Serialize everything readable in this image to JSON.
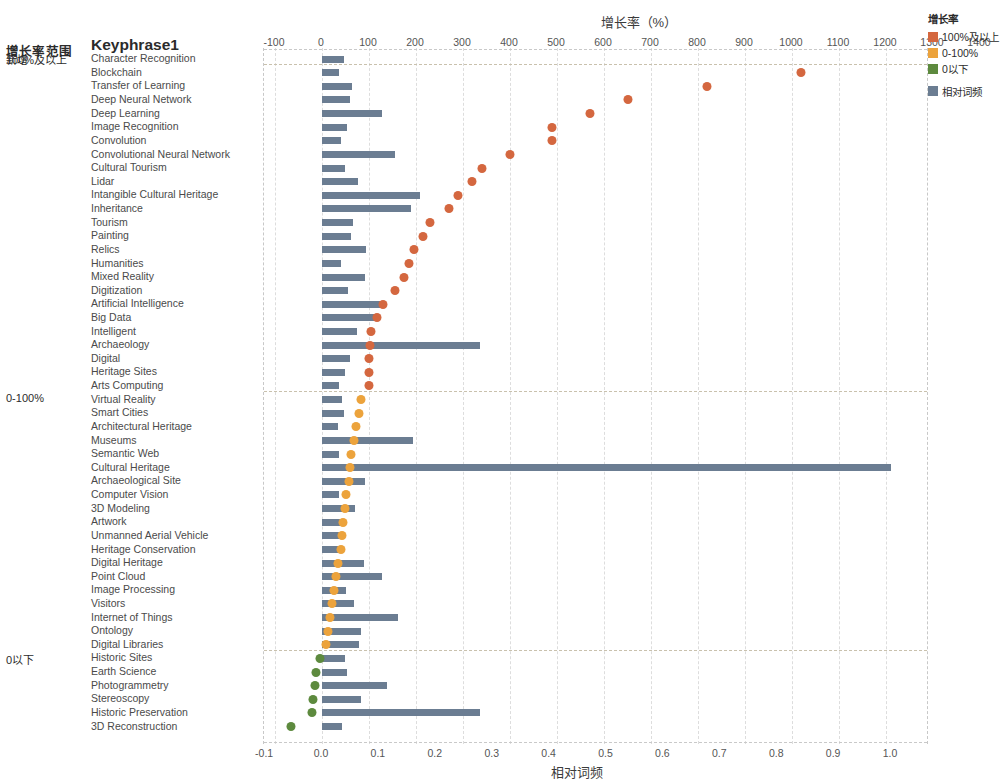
{
  "chart_data": {
    "type": "bar",
    "title": "",
    "top_axis": {
      "label": "增长率（%）",
      "ticks": [
        -100,
        0,
        100,
        200,
        300,
        400,
        500,
        600,
        700,
        800,
        900,
        1000,
        1100,
        1200,
        1300,
        1400,
        1500
      ],
      "range": [
        -100,
        1520
      ]
    },
    "bottom_axis": {
      "label": "相对词频",
      "ticks": [
        "-0.1",
        "0.0",
        "0.1",
        "0.2",
        "0.3",
        "0.4",
        "0.5",
        "0.6",
        "0.7",
        "0.8",
        "0.9",
        "1.0"
      ],
      "tick_values": [
        -0.1,
        0.0,
        0.1,
        0.2,
        0.3,
        0.4,
        0.5,
        0.6,
        0.7,
        0.8,
        0.9,
        1.0
      ],
      "range": [
        -0.115,
        1.06
      ]
    },
    "row_header_left": "增长率范围",
    "row_header_right": "Keyphrase1",
    "groups": [
      {
        "label": "新增",
        "start_index": 0,
        "count": 0
      },
      {
        "label": "100%及以上",
        "start_index": 0,
        "count": 25
      },
      {
        "label": "0-100%",
        "start_index": 25,
        "count": 19
      },
      {
        "label": "0以下",
        "start_index": 44,
        "count": 6
      }
    ],
    "series": [
      {
        "name": "增长率",
        "kind": "dot",
        "unit": "%"
      },
      {
        "name": "相对词频",
        "kind": "bar",
        "unit": ""
      }
    ],
    "rows": [
      {
        "keyphrase": "Character Recognition",
        "growth": 1480,
        "freq": 0.038,
        "band": "100%及以上"
      },
      {
        "keyphrase": "Blockchain",
        "growth": 1020,
        "freq": 0.029,
        "band": "100%及以上"
      },
      {
        "keyphrase": "Transfer of Learning",
        "growth": 820,
        "freq": 0.053,
        "band": "100%及以上"
      },
      {
        "keyphrase": "Deep Neural Network",
        "growth": 650,
        "freq": 0.049,
        "band": "100%及以上"
      },
      {
        "keyphrase": "Deep Learning",
        "growth": 570,
        "freq": 0.105,
        "band": "100%及以上"
      },
      {
        "keyphrase": "Image Recognition",
        "growth": 490,
        "freq": 0.044,
        "band": "100%及以上"
      },
      {
        "keyphrase": "Convolution",
        "growth": 490,
        "freq": 0.033,
        "band": "100%及以上"
      },
      {
        "keyphrase": "Convolutional Neural Network",
        "growth": 400,
        "freq": 0.128,
        "band": "100%及以上"
      },
      {
        "keyphrase": "Cultural Tourism",
        "growth": 340,
        "freq": 0.041,
        "band": "100%及以上"
      },
      {
        "keyphrase": "Lidar",
        "growth": 320,
        "freq": 0.063,
        "band": "100%及以上"
      },
      {
        "keyphrase": "Intangible Cultural Heritage",
        "growth": 290,
        "freq": 0.173,
        "band": "100%及以上"
      },
      {
        "keyphrase": "Inheritance",
        "growth": 270,
        "freq": 0.156,
        "band": "100%及以上"
      },
      {
        "keyphrase": "Tourism",
        "growth": 230,
        "freq": 0.055,
        "band": "100%及以上"
      },
      {
        "keyphrase": "Painting",
        "growth": 215,
        "freq": 0.051,
        "band": "100%及以上"
      },
      {
        "keyphrase": "Relics",
        "growth": 195,
        "freq": 0.078,
        "band": "100%及以上"
      },
      {
        "keyphrase": "Humanities",
        "growth": 185,
        "freq": 0.034,
        "band": "100%及以上"
      },
      {
        "keyphrase": "Mixed Reality",
        "growth": 175,
        "freq": 0.076,
        "band": "100%及以上"
      },
      {
        "keyphrase": "Digitization",
        "growth": 155,
        "freq": 0.045,
        "band": "100%及以上"
      },
      {
        "keyphrase": "Artificial Intelligence",
        "growth": 130,
        "freq": 0.102,
        "band": "100%及以上"
      },
      {
        "keyphrase": "Big Data",
        "growth": 118,
        "freq": 0.095,
        "band": "100%及以上"
      },
      {
        "keyphrase": "Intelligent",
        "growth": 105,
        "freq": 0.062,
        "band": "100%及以上"
      },
      {
        "keyphrase": "Archaeology",
        "growth": 103,
        "freq": 0.278,
        "band": "100%及以上"
      },
      {
        "keyphrase": "Digital",
        "growth": 100,
        "freq": 0.05,
        "band": "100%及以上"
      },
      {
        "keyphrase": "Heritage Sites",
        "growth": 100,
        "freq": 0.041,
        "band": "100%及以上"
      },
      {
        "keyphrase": "Arts Computing",
        "growth": 100,
        "freq": 0.03,
        "band": "100%及以上"
      },
      {
        "keyphrase": "Virtual Reality",
        "growth": 82,
        "freq": 0.035,
        "band": "0-100%"
      },
      {
        "keyphrase": "Smart Cities",
        "growth": 78,
        "freq": 0.038,
        "band": "0-100%"
      },
      {
        "keyphrase": "Architectural Heritage",
        "growth": 72,
        "freq": 0.028,
        "band": "0-100%"
      },
      {
        "keyphrase": "Museums",
        "growth": 68,
        "freq": 0.16,
        "band": "0-100%"
      },
      {
        "keyphrase": "Semantic Web",
        "growth": 62,
        "freq": 0.03,
        "band": "0-100%"
      },
      {
        "keyphrase": "Cultural Heritage",
        "growth": 60,
        "freq": 1.0,
        "band": "0-100%"
      },
      {
        "keyphrase": "Archaeological Site",
        "growth": 58,
        "freq": 0.076,
        "band": "0-100%"
      },
      {
        "keyphrase": "Computer Vision",
        "growth": 52,
        "freq": 0.03,
        "band": "0-100%"
      },
      {
        "keyphrase": "3D Modeling",
        "growth": 48,
        "freq": 0.058,
        "band": "0-100%"
      },
      {
        "keyphrase": "Artwork",
        "growth": 45,
        "freq": 0.032,
        "band": "0-100%"
      },
      {
        "keyphrase": "Unmanned Aerial Vehicle",
        "growth": 42,
        "freq": 0.031,
        "band": "0-100%"
      },
      {
        "keyphrase": "Heritage Conservation",
        "growth": 40,
        "freq": 0.032,
        "band": "0-100%"
      },
      {
        "keyphrase": "Digital Heritage",
        "growth": 35,
        "freq": 0.073,
        "band": "0-100%"
      },
      {
        "keyphrase": "Point Cloud",
        "growth": 30,
        "freq": 0.105,
        "band": "0-100%"
      },
      {
        "keyphrase": "Image Processing",
        "growth": 25,
        "freq": 0.042,
        "band": "0-100%"
      },
      {
        "keyphrase": "Visitors",
        "growth": 22,
        "freq": 0.056,
        "band": "0-100%"
      },
      {
        "keyphrase": "Internet of Things",
        "growth": 18,
        "freq": 0.133,
        "band": "0-100%"
      },
      {
        "keyphrase": "Ontology",
        "growth": 12,
        "freq": 0.068,
        "band": "0-100%"
      },
      {
        "keyphrase": "Digital Libraries",
        "growth": 8,
        "freq": 0.065,
        "band": "0-100%"
      },
      {
        "keyphrase": "Historic Sites",
        "growth": -5,
        "freq": 0.04,
        "band": "0以下"
      },
      {
        "keyphrase": "Earth Science",
        "growth": -12,
        "freq": 0.044,
        "band": "0以下"
      },
      {
        "keyphrase": "Photogrammetry",
        "growth": -15,
        "freq": 0.115,
        "band": "0以下"
      },
      {
        "keyphrase": "Stereoscopy",
        "growth": -20,
        "freq": 0.069,
        "band": "0以下"
      },
      {
        "keyphrase": "Historic Preservation",
        "growth": -22,
        "freq": 0.278,
        "band": "0以下"
      },
      {
        "keyphrase": "3D Reconstruction",
        "growth": -66,
        "freq": 0.036,
        "band": "0以下"
      }
    ],
    "colors": {
      "band_100_plus": "#d4673f",
      "band_0_100": "#eca33c",
      "band_below_0": "#5d8a3e",
      "bar": "#6b7d92",
      "grid": "#dddddd",
      "separator": "#c9c1ad"
    }
  },
  "legend": {
    "title": "增长率",
    "items": [
      {
        "label": "100%及以上",
        "color": "#d4673f"
      },
      {
        "label": "0-100%",
        "color": "#eca33c"
      },
      {
        "label": "0以下",
        "color": "#5d8a3e"
      }
    ],
    "extra": [
      {
        "label": "相对词频",
        "color": "#6b7d92"
      }
    ]
  }
}
